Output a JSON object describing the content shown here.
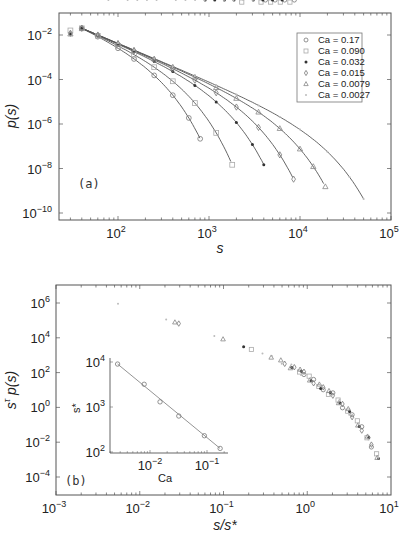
{
  "chart_data": [
    {
      "panel": "(a)",
      "type": "scatter",
      "title": "",
      "xlabel": "s",
      "ylabel": "p(s)",
      "xscale": "log",
      "yscale": "log",
      "xlim": [
        22,
        100000
      ],
      "ylim": [
        5e-11,
        0.1
      ],
      "xticks": [
        "10^2",
        "10^3",
        "10^4",
        "10^5"
      ],
      "yticks": [
        "10^-2",
        "10^-4",
        "10^-6",
        "10^-8",
        "10^-10"
      ],
      "legend_position": "upper right",
      "grid": false,
      "annotation": "(a)",
      "series": [
        {
          "name": "Ca = 0.17",
          "marker": "circle",
          "color": "#777777",
          "x": [
            40,
            60,
            100,
            150,
            250,
            400,
            600,
            800
          ],
          "y": [
            0.012,
            0.0045,
            0.0012,
            0.00032,
            6e-05,
            6e-06,
            5e-07,
            3e-08
          ]
        },
        {
          "name": "Ca = 0.090",
          "marker": "square",
          "color": "#aaaaaa",
          "x": [
            30,
            40,
            60,
            100,
            150,
            250,
            400,
            700,
            1200,
            1800
          ],
          "y": [
            0.016,
            0.011,
            0.005,
            0.0016,
            0.0006,
            0.00016,
            4e-05,
            5e-06,
            3e-07,
            2e-08
          ]
        },
        {
          "name": "Ca = 0.032",
          "marker": "star",
          "color": "#333333",
          "x": [
            30,
            40,
            60,
            100,
            150,
            250,
            400,
            700,
            1200,
            2000,
            3000,
            4000
          ],
          "y": [
            0.011,
            0.01,
            0.0055,
            0.0018,
            0.0008,
            0.00028,
            9e-05,
            2e-05,
            3.5e-06,
            5e-07,
            5e-08,
            1.2e-08
          ]
        },
        {
          "name": "Ca = 0.015",
          "marker": "diamond",
          "color": "#777777",
          "x": [
            30,
            40,
            60,
            100,
            150,
            250,
            400,
            700,
            1200,
            2000,
            3500,
            6000,
            8500
          ],
          "y": [
            0.012,
            0.01,
            0.006,
            0.002,
            0.00095,
            0.00035,
            0.00013,
            3.5e-05,
            9e-06,
            2e-06,
            2.5e-07,
            1.5e-08,
            2e-09
          ]
        },
        {
          "name": "Ca = 0.0079",
          "marker": "triangle",
          "color": "#888888",
          "x": [
            30,
            40,
            60,
            100,
            150,
            250,
            400,
            700,
            1200,
            2000,
            3500,
            6000,
            10000,
            14000,
            19000
          ],
          "y": [
            0.011,
            0.011,
            0.0065,
            0.0022,
            0.001,
            0.0004,
            0.00016,
            5e-05,
            1.5e-05,
            4.5e-06,
            1e-06,
            1.5e-07,
            1.8e-08,
            6e-09,
            3e-10
          ]
        },
        {
          "name": "Ca = 0.0027",
          "marker": "dot",
          "color": "#bbbbbb",
          "x": [
            60,
            100,
            150,
            250,
            400,
            700,
            1200,
            2000,
            3500,
            6000,
            10000,
            20000,
            35000,
            50000
          ],
          "y": [
            0.007,
            0.0024,
            0.0011,
            0.00045,
            0.00018,
            6e-05,
            2e-05,
            7e-06,
            2e-06,
            5e-07,
            1.2e-07,
            1e-08,
            8e-10,
            1.5e-10
          ]
        }
      ],
      "fit_curves": [
        {
          "name": "Ca = 0.17",
          "s_star": 120,
          "end": 800
        },
        {
          "name": "Ca = 0.090",
          "s_star": 230,
          "end": 1800
        },
        {
          "name": "Ca = 0.032",
          "s_star": 630,
          "end": 4000
        },
        {
          "name": "Ca = 0.015",
          "s_star": 1300,
          "end": 8500
        },
        {
          "name": "Ca = 0.0079",
          "s_star": 3200,
          "end": 19000
        },
        {
          "name": "Ca = 0.0027",
          "s_star": 9000,
          "end": 52000
        }
      ]
    },
    {
      "panel": "(b)",
      "type": "scatter",
      "title": "",
      "xlabel": "s/s*",
      "ylabel": "s^τ p(s)",
      "xscale": "log",
      "yscale": "log",
      "xlim": [
        0.001,
        10
      ],
      "ylim": [
        1e-05,
        10000000.0
      ],
      "xticks": [
        "10^-3",
        "10^-2",
        "10^-1",
        "10^0",
        "10^1"
      ],
      "yticks": [
        "10^6",
        "10^4",
        "10^2",
        "10^0",
        "10^-2",
        "10^-4"
      ],
      "grid": false,
      "annotation": "(b)",
      "collapse_curve": {
        "x": [
          0.0035,
          0.006,
          0.01,
          0.02,
          0.04,
          0.08,
          0.15,
          0.3,
          0.6,
          1.0,
          2.0,
          3.5,
          5.0,
          7.0
        ],
        "y": [
          1000000,
          900000,
          400000,
          120000,
          40000,
          12000,
          4000,
          1200,
          250,
          60,
          5,
          0.3,
          0.03,
          0.001
        ]
      },
      "inset": {
        "type": "line",
        "xlabel": "Ca",
        "ylabel": "s*",
        "xscale": "log",
        "yscale": "log",
        "xlim": [
          0.002,
          0.2
        ],
        "ylim": [
          100,
          10000
        ],
        "xticks": [
          "10^-2",
          "10^-1"
        ],
        "yticks": [
          "10^4",
          "10^3",
          "10^2"
        ],
        "x": [
          0.0027,
          0.0079,
          0.015,
          0.032,
          0.09,
          0.17
        ],
        "y": [
          9000,
          3200,
          1300,
          630,
          230,
          120
        ]
      }
    }
  ],
  "labels": {
    "panel_a_tag": "(a)",
    "panel_b_tag": "(b)",
    "a_xlabel": "s",
    "a_ylabel": "p(s)",
    "b_xlabel": "s/s*",
    "b_ylabel_base": "s",
    "b_ylabel_sup": "τ",
    "b_ylabel_rest": " p(s)",
    "inset_xlabel": "Ca",
    "inset_ylabel": "s*"
  }
}
